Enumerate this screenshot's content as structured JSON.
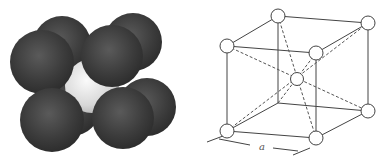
{
  "figure": {
    "left_panel": {
      "description": "Space-filling model of body-centered cubic unit cell",
      "corner_atom_color": "#3a3a3a",
      "center_atom_color": "#e8e8e8",
      "atoms": [
        {
          "id": "back-top-right",
          "cx": 133,
          "cy": 42,
          "r": 29,
          "type": "corner"
        },
        {
          "id": "back-top-left",
          "cx": 62,
          "cy": 45,
          "r": 29,
          "type": "corner"
        },
        {
          "id": "back-bottom-right",
          "cx": 147,
          "cy": 107,
          "r": 29,
          "type": "corner"
        },
        {
          "id": "back-bottom-left",
          "cx": 72,
          "cy": 108,
          "r": 28,
          "type": "corner"
        },
        {
          "id": "center",
          "cx": 92,
          "cy": 86,
          "r": 27,
          "type": "center"
        },
        {
          "id": "front-top-left",
          "cx": 42,
          "cy": 62,
          "r": 32,
          "type": "corner"
        },
        {
          "id": "front-top-right",
          "cx": 112,
          "cy": 56,
          "r": 31,
          "type": "corner"
        },
        {
          "id": "front-bottom-left",
          "cx": 52,
          "cy": 120,
          "r": 32,
          "type": "corner"
        },
        {
          "id": "front-bottom-right",
          "cx": 123,
          "cy": 118,
          "r": 31,
          "type": "corner"
        }
      ]
    },
    "right_panel": {
      "description": "Ball-and-stick model of body-centered cubic unit cell",
      "line_color": "#444444",
      "dimension_label": "a",
      "nodes": {
        "back_top_left": [
          83,
          16
        ],
        "back_top_right": [
          173,
          23
        ],
        "back_bottom_left": [
          83,
          103
        ],
        "back_bottom_right": [
          173,
          111
        ],
        "front_top_left": [
          32,
          46
        ],
        "front_top_right": [
          121,
          53
        ],
        "front_bottom_left": [
          32,
          131
        ],
        "front_bottom_right": [
          121,
          138
        ],
        "center": [
          102,
          79
        ]
      }
    }
  }
}
